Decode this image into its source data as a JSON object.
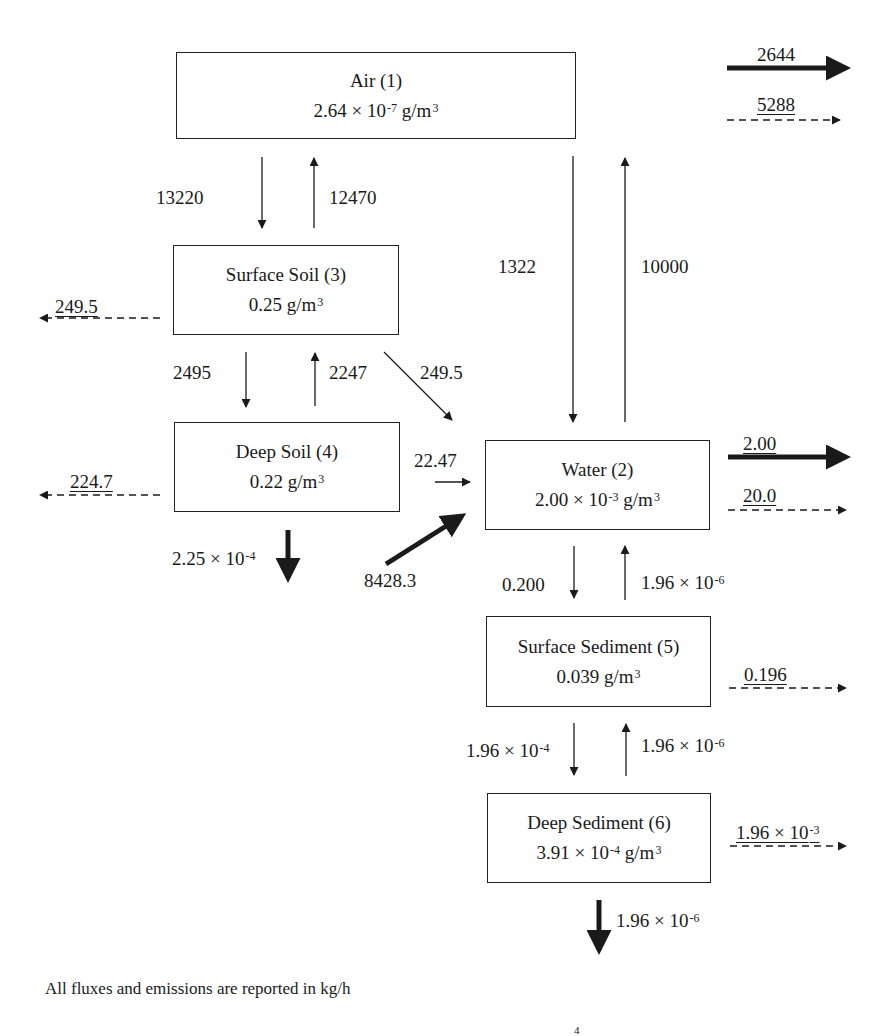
{
  "diagram": {
    "type": "multimedia fugacity mass-balance flow diagram",
    "compartments": [
      {
        "id": "air",
        "name": "Air (1)",
        "conc_mantissa": "2.64 × 10",
        "conc_exp": "-7",
        "conc_unit": " g/m",
        "unit_exp": "3"
      },
      {
        "id": "water",
        "name": "Water (2)",
        "conc_mantissa": "2.00 × 10",
        "conc_exp": "-3",
        "conc_unit": " g/m",
        "unit_exp": "3"
      },
      {
        "id": "surface_soil",
        "name": "Surface Soil (3)",
        "conc_mantissa": "0.25",
        "conc_exp": "",
        "conc_unit": " g/m",
        "unit_exp": "3"
      },
      {
        "id": "deep_soil",
        "name": "Deep Soil (4)",
        "conc_mantissa": "0.22",
        "conc_exp": "",
        "conc_unit": " g/m",
        "unit_exp": "3"
      },
      {
        "id": "surface_sediment",
        "name": "Surface Sediment (5)",
        "conc_mantissa": "0.039",
        "conc_exp": "",
        "conc_unit": " g/m",
        "unit_exp": "3"
      },
      {
        "id": "deep_sediment",
        "name": "Deep Sediment (6)",
        "conc_mantissa": "3.91 × 10",
        "conc_exp": "-4",
        "conc_unit": " g/m",
        "unit_exp": "3"
      }
    ],
    "flows": {
      "air_advection_out": {
        "value": "2644",
        "style": "thick-solid"
      },
      "air_reaction_loss": {
        "value": "5288",
        "style": "dashed"
      },
      "air_to_surface_soil": {
        "value": "13220"
      },
      "surface_soil_to_air": {
        "value": "12470"
      },
      "air_to_water": {
        "value": "1322"
      },
      "water_to_air": {
        "value": "10000"
      },
      "surface_soil_reaction_loss": {
        "value": "249.5",
        "style": "dashed"
      },
      "surface_soil_to_deep_soil": {
        "value": "2495"
      },
      "deep_soil_to_surface_soil": {
        "value": "2247"
      },
      "surface_soil_to_water": {
        "value": "249.5"
      },
      "deep_soil_reaction_loss": {
        "value": "224.7",
        "style": "dashed"
      },
      "deep_soil_to_water": {
        "value": "22.47"
      },
      "deep_soil_burial_mantissa": "2.25 × 10",
      "deep_soil_burial_exp": "-4",
      "emission_to_water": {
        "value": "8428.3",
        "style": "thick-solid"
      },
      "water_advection_out": {
        "value": "2.00",
        "style": "thick-solid"
      },
      "water_reaction_loss": {
        "value": "20.0",
        "style": "dashed"
      },
      "water_to_surface_sediment": {
        "value": "0.200"
      },
      "surface_sediment_to_water_mantissa": "1.96 × 10",
      "surface_sediment_to_water_exp": "-6",
      "surface_sediment_reaction_loss": {
        "value": "0.196",
        "style": "dashed"
      },
      "surface_to_deep_sediment_mantissa": "1.96 × 10",
      "surface_to_deep_sediment_exp": "-4",
      "deep_to_surface_sediment_mantissa": "1.96 × 10",
      "deep_to_surface_sediment_exp": "-6",
      "deep_sediment_reaction_loss_mantissa": "1.96 × 10",
      "deep_sediment_reaction_loss_exp": "-3",
      "deep_sediment_burial_mantissa": "1.96 × 10",
      "deep_sediment_burial_exp": "-6"
    },
    "footnote": "All fluxes and emissions are reported in kg/h",
    "truncated_line_sup": "4"
  }
}
